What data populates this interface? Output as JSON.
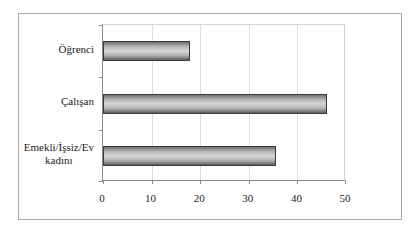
{
  "chart_data": {
    "type": "bar",
    "orientation": "horizontal",
    "title": "",
    "xlabel": "",
    "ylabel": "",
    "categories": [
      "Öğrenci",
      "Çalışan",
      "Emekli/İşsiz/Ev kadını"
    ],
    "category_lines": [
      [
        "Öğrenci"
      ],
      [
        "Çalışan"
      ],
      [
        "Emekli/İşsiz/Ev",
        "kadını"
      ]
    ],
    "values": [
      18,
      46,
      35.5
    ],
    "xlim": [
      0,
      50
    ],
    "xticks": [
      "0",
      "10",
      "20",
      "30",
      "40",
      "50"
    ],
    "grid": true,
    "legend": null,
    "bar_color": "#b5b5b5",
    "bar_border": "#3a3a3a"
  }
}
